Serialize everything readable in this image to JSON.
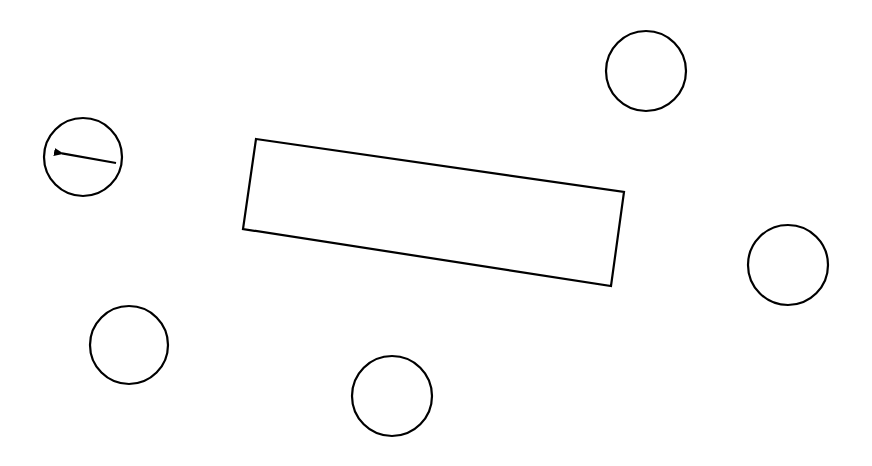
{
  "canvas": {
    "width": 872,
    "height": 466,
    "background": "#ffffff",
    "stroke": "#000000",
    "stroke_width": 2.2
  },
  "table": {
    "points": [
      [
        256,
        139
      ],
      [
        624,
        192
      ],
      [
        611,
        286
      ],
      [
        243,
        229
      ]
    ]
  },
  "agent": {
    "cx": 83,
    "cy": 157,
    "r": 39,
    "arrow": {
      "x1": 116,
      "y1": 163,
      "x2": 54,
      "y2": 152
    }
  },
  "circles": [
    {
      "cx": 646,
      "cy": 71,
      "r": 40
    },
    {
      "cx": 788,
      "cy": 265,
      "r": 40
    },
    {
      "cx": 129,
      "cy": 345,
      "r": 39
    },
    {
      "cx": 392,
      "cy": 396,
      "r": 40
    }
  ]
}
